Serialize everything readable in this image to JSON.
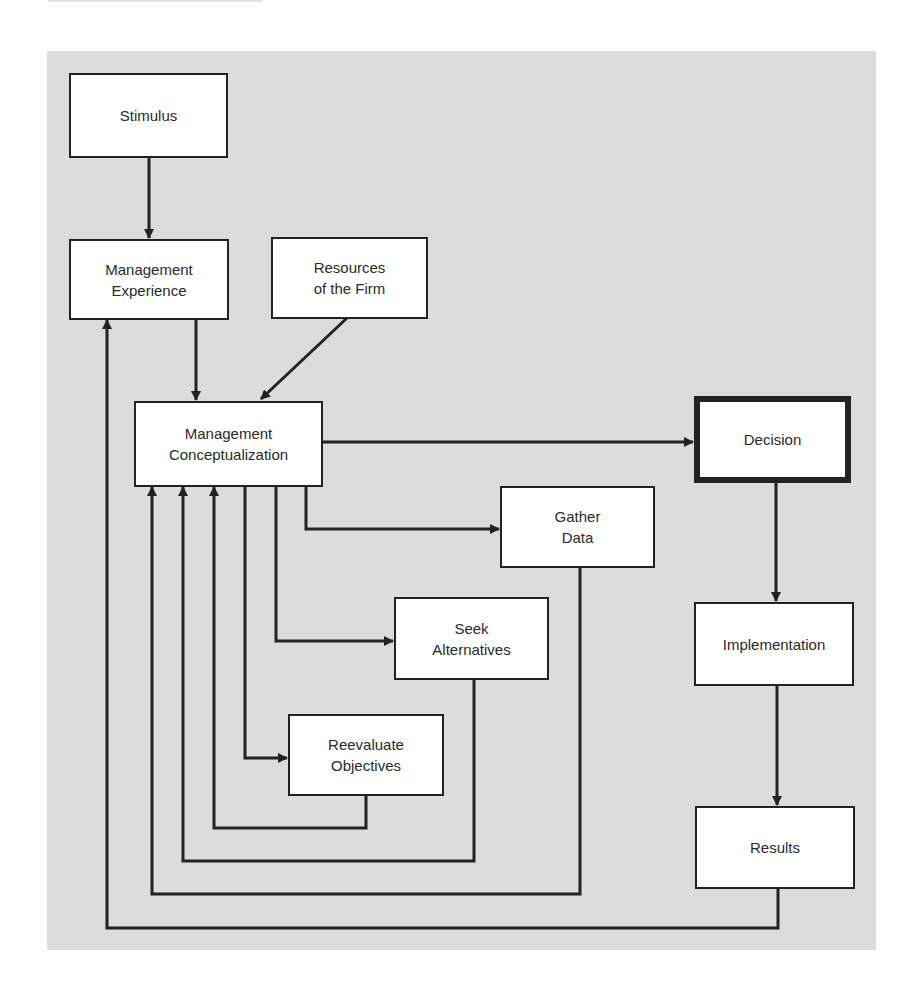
{
  "diagram": {
    "type": "flowchart",
    "colors": {
      "background_panel": "#dcdcdc",
      "box_fill": "#ffffff",
      "line": "#222222"
    },
    "nodes": [
      {
        "id": "stimulus",
        "lines": [
          "Stimulus"
        ]
      },
      {
        "id": "management_experience",
        "lines": [
          "Management",
          "Experience"
        ]
      },
      {
        "id": "resources",
        "lines": [
          "Resources",
          "of the Firm"
        ]
      },
      {
        "id": "management_conceptualization",
        "lines": [
          "Management",
          "Conceptualization"
        ]
      },
      {
        "id": "decision",
        "lines": [
          "Decision"
        ],
        "emphasis": "thick-border"
      },
      {
        "id": "gather_data",
        "lines": [
          "Gather",
          "Data"
        ]
      },
      {
        "id": "seek_alternatives",
        "lines": [
          "Seek",
          "Alternatives"
        ]
      },
      {
        "id": "reevaluate_objectives",
        "lines": [
          "Reevaluate",
          "Objectives"
        ]
      },
      {
        "id": "implementation",
        "lines": [
          "Implementation"
        ]
      },
      {
        "id": "results",
        "lines": [
          "Results"
        ]
      }
    ],
    "edges": [
      {
        "from": "stimulus",
        "to": "management_experience"
      },
      {
        "from": "management_experience",
        "to": "management_conceptualization"
      },
      {
        "from": "resources",
        "to": "management_conceptualization"
      },
      {
        "from": "management_conceptualization",
        "to": "decision"
      },
      {
        "from": "management_conceptualization",
        "to": "gather_data"
      },
      {
        "from": "management_conceptualization",
        "to": "seek_alternatives"
      },
      {
        "from": "management_conceptualization",
        "to": "reevaluate_objectives"
      },
      {
        "from": "reevaluate_objectives",
        "to": "management_conceptualization"
      },
      {
        "from": "seek_alternatives",
        "to": "management_conceptualization"
      },
      {
        "from": "gather_data",
        "to": "management_conceptualization"
      },
      {
        "from": "decision",
        "to": "implementation"
      },
      {
        "from": "implementation",
        "to": "results"
      },
      {
        "from": "results",
        "to": "management_experience"
      }
    ]
  }
}
